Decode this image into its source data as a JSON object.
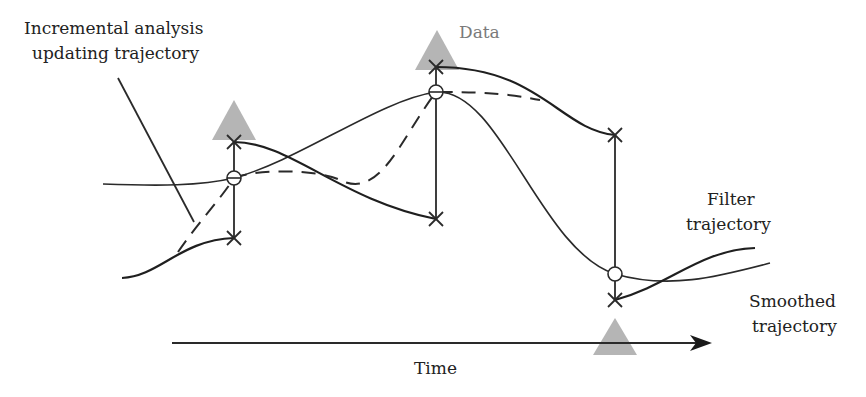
{
  "labels": {
    "incremental_line1": "Incremental analysis",
    "incremental_line2": "updating trajectory",
    "data": "Data",
    "filter_line1": "Filter",
    "filter_line2": "trajectory",
    "smoothed_line1": "Smoothed",
    "smoothed_line2": "trajectory",
    "time": "Time"
  },
  "colors": {
    "line": "#2a2a2a",
    "triangle": "#b5b5b5",
    "data_label": "#7a7a7a"
  },
  "data_points": [
    {
      "x": 234,
      "filter_top": 142,
      "filter_bottom": 238,
      "analysis": 178,
      "triangle_tip": 100,
      "triangle_base": 140,
      "triangle_position": "above"
    },
    {
      "x": 436,
      "filter_top": 67,
      "filter_bottom": 219,
      "analysis": 92,
      "triangle_tip": 30,
      "triangle_base": 70,
      "triangle_position": "above"
    },
    {
      "x": 615,
      "filter_top": 135,
      "filter_bottom": 300,
      "analysis": 274,
      "triangle_tip": 318,
      "triangle_base": 355,
      "triangle_position": "below"
    }
  ]
}
